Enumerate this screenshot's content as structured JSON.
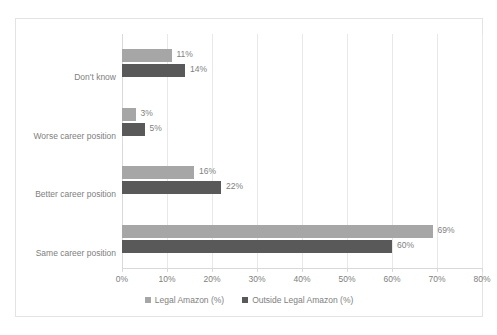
{
  "chart_data": {
    "type": "bar",
    "orientation": "horizontal",
    "title": "",
    "xlabel": "",
    "ylabel": "",
    "xlim": [
      0,
      80
    ],
    "xticks": [
      "0%",
      "10%",
      "20%",
      "30%",
      "40%",
      "50%",
      "60%",
      "70%",
      "80%"
    ],
    "grid": true,
    "legend_position": "bottom",
    "categories": [
      "Same career position",
      "Better career position",
      "Worse career position",
      "Don't know"
    ],
    "series": [
      {
        "name": "Legal Amazon (%)",
        "color": "#a6a6a6",
        "values": [
          69,
          16,
          3,
          11
        ],
        "labels": [
          "69%",
          "16%",
          "3%",
          "11%"
        ]
      },
      {
        "name": "Outside Legal Amazon (%)",
        "color": "#595959",
        "values": [
          60,
          22,
          5,
          14
        ],
        "labels": [
          "60%",
          "22%",
          "5%",
          "14%"
        ]
      }
    ]
  }
}
